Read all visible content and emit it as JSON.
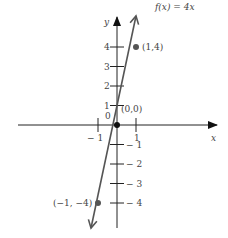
{
  "chart_data": {
    "type": "line",
    "title": "",
    "function_label": "f(x) = 4x",
    "xlabel": "x",
    "ylabel": "y",
    "xlim": [
      -3,
      2.5
    ],
    "ylim": [
      -5.2,
      5.5
    ],
    "x_ticks": [
      -1,
      1
    ],
    "x_tick_labels": [
      "− 1",
      "1"
    ],
    "y_ticks": [
      4,
      3,
      2,
      1,
      -1,
      -2,
      -3,
      -4
    ],
    "y_tick_labels": [
      "4",
      "3",
      "2",
      "1",
      "− 1",
      "− 2",
      "− 3",
      "− 4"
    ],
    "origin_label": "0",
    "series": [
      {
        "name": "f(x) = 4x",
        "x": [
          -1.3,
          1.3
        ],
        "y": [
          -5.2,
          5.2
        ]
      }
    ],
    "points": [
      {
        "x": 1,
        "y": 4,
        "label": "(1,4)"
      },
      {
        "x": 0,
        "y": 0,
        "label": "(0,0)"
      },
      {
        "x": -1,
        "y": -4,
        "label": "(−1, −4)"
      }
    ],
    "grid": false,
    "legend": "none"
  },
  "colors": {
    "axis": "#222222",
    "line": "#555555",
    "point": "#555555",
    "text": "#444444"
  }
}
